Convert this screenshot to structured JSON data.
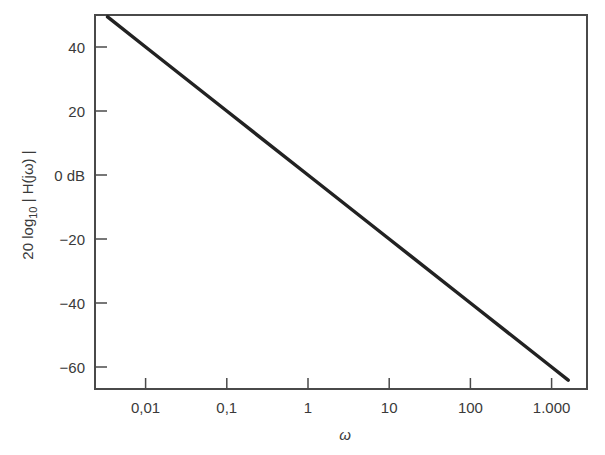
{
  "chart_data": {
    "type": "line",
    "title": "",
    "xlabel": "ω",
    "ylabel": "20 log10 | H(jω) |",
    "ylabel_parts": {
      "prefix": "20 log",
      "sub": "10",
      "suffix": " | H(jω) |"
    },
    "xscale": "log",
    "xlim": [
      0.0034,
      2200
    ],
    "ylim": [
      -67,
      50
    ],
    "x_ticks": [
      0.01,
      0.1,
      1,
      10,
      100,
      1000
    ],
    "x_tick_labels": [
      "0,01",
      "0,1",
      "1",
      "10",
      "100",
      "1.000"
    ],
    "y_ticks": [
      40,
      20,
      0,
      -20,
      -40,
      -60
    ],
    "y_tick_labels": [
      "40",
      "20",
      "0 dB",
      "−20",
      "−40",
      "−60"
    ],
    "grid": false,
    "legend": null,
    "series": [
      {
        "name": "20 log10 |H(jω)|",
        "slope_db_per_decade": -20,
        "x": [
          0.0034,
          0.01,
          0.1,
          1,
          10,
          100,
          1000,
          1600
        ],
        "values": [
          49.4,
          40,
          20,
          0,
          -20,
          -40,
          -60,
          -64.1
        ]
      }
    ]
  }
}
